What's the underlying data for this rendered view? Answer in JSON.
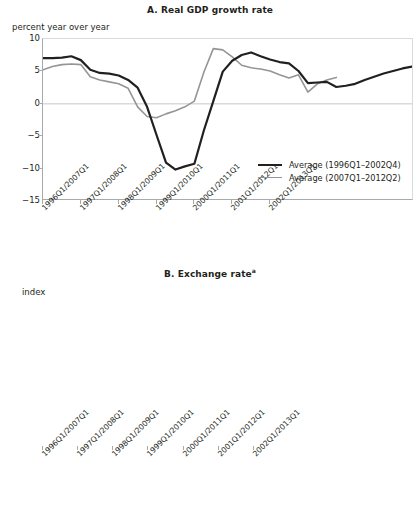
{
  "figure": {
    "panels": [
      {
        "id": "A",
        "title": "A. Real GDP growth rate",
        "title_superscript": "",
        "axis_unit": "percent year over year"
      },
      {
        "id": "B",
        "title": "B. Exchange rate",
        "title_superscript": "a",
        "axis_unit": "index"
      }
    ]
  },
  "legend": {
    "series_black": "Average (1996Q1–2002Q4)",
    "series_gray": "Average (2007Q1–2012Q2)",
    "color_black": "#231f20",
    "color_gray": "#939598"
  },
  "chart_data": [
    {
      "type": "line",
      "title": "A. Real GDP growth rate",
      "xlabel": "",
      "ylabel": "percent year over year",
      "ylim": [
        -15,
        10
      ],
      "yticks": [
        10,
        5,
        0,
        -5,
        -10,
        -15
      ],
      "ytick_labels": [
        "10",
        "5",
        "0",
        "−5",
        "−10",
        "−15"
      ],
      "xticks": [
        0,
        4,
        8,
        12,
        16,
        20,
        24
      ],
      "xtick_labels": [
        "1996Q1/2007Q1",
        "1997Q1/2008Q1",
        "1998Q1/2009Q1",
        "1999Q1/2010Q1",
        "2000Q1/2011Q1",
        "2001Q1/2012Q1",
        "2002Q1/2013Q1"
      ],
      "grid": false,
      "zero_line": true,
      "legend_position": "lower-right",
      "x": [
        0,
        1,
        2,
        3,
        4,
        5,
        6,
        7,
        8,
        9,
        10,
        11,
        12,
        13,
        14,
        15,
        16,
        17,
        18,
        19,
        20,
        21,
        22,
        23,
        24,
        25,
        26
      ],
      "series": [
        {
          "name": "Average (1996Q1–2002Q4)",
          "color": "#231f20",
          "values": [
            7.0,
            7.0,
            7.1,
            7.3,
            6.7,
            5.2,
            4.7,
            4.6,
            4.3,
            3.6,
            2.4,
            -0.6,
            -5.0,
            -9.3,
            -10.4,
            -9.9,
            -9.5,
            -4.3,
            0.3,
            4.9,
            6.6,
            7.5,
            7.9,
            7.3,
            6.8,
            6.4,
            6.2
          ]
        },
        {
          "name": "Average (2007Q1–2012Q2)",
          "color": "#939598",
          "values": [
            5.2,
            5.7,
            6.0,
            6.1,
            6.0,
            4.1,
            3.6,
            3.3,
            3.0,
            2.3,
            -0.6,
            -2.1,
            -2.3,
            -1.7,
            -1.2,
            -0.6,
            0.3,
            4.8,
            8.5,
            8.3,
            7.2,
            5.9,
            5.5,
            5.3,
            5.0,
            4.4,
            3.9
          ]
        }
      ],
      "series_extended": [
        {
          "name": "Average (1996Q1–2002Q4)",
          "color": "#231f20",
          "values_tail": [
            5.0,
            3.1,
            3.2,
            3.3,
            2.5,
            2.7,
            3.0,
            3.6,
            4.1,
            4.6,
            5.0,
            5.4,
            5.7
          ]
        },
        {
          "name": "Average (2007Q1–2012Q2)",
          "color": "#939598",
          "values_tail": [
            4.4,
            1.7,
            3.0,
            3.6,
            4.0
          ]
        }
      ]
    },
    {
      "type": "line",
      "title": "B. Exchange rate",
      "title_note": "a",
      "xlabel": "",
      "ylabel": "index",
      "ylim": [
        0,
        250
      ],
      "yticks": [
        250,
        200,
        150,
        100,
        50,
        0
      ],
      "ytick_labels": [
        "250",
        "200",
        "150",
        "100",
        "50",
        "0"
      ],
      "xticks": [
        0,
        4,
        8,
        12,
        16,
        20,
        24
      ],
      "xtick_labels": [
        "1996Q1/2007Q1",
        "1997Q1/2008Q1",
        "1998Q1/2009Q1",
        "1999Q1/2010Q1",
        "2000Q1/2011Q1",
        "2001Q1/2012Q1",
        "2002Q1/2013Q1"
      ],
      "grid": false,
      "legend_position": "lower-right",
      "x": [
        0,
        1,
        2,
        3,
        4,
        5,
        6,
        7,
        8,
        9,
        10,
        11,
        12,
        13,
        14,
        15,
        16,
        17,
        18,
        19,
        20,
        21,
        22,
        23,
        24,
        25,
        26,
        27
      ],
      "series": [
        {
          "name": "Average (1996Q1–2002Q4)",
          "color": "#231f20",
          "values": [
            100,
            100,
            100,
            100,
            101,
            102,
            103,
            105,
            106,
            118,
            150,
            186,
            221,
            220,
            218,
            227,
            236,
            205,
            191,
            194,
            193,
            189,
            187,
            186,
            184,
            184,
            190,
            197
          ]
        },
        {
          "name": "Average (2007Q1–2012Q2)",
          "color": "#939598",
          "values": [
            100,
            100,
            99,
            97,
            96,
            95,
            96,
            99,
            101,
            107,
            112,
            115,
            114,
            112,
            110,
            108,
            106,
            104,
            102,
            100,
            99,
            97,
            96,
            95,
            94,
            94,
            95,
            97
          ]
        }
      ],
      "series_extended": [
        {
          "name": "Average (1996Q1–2002Q4)",
          "color": "#231f20",
          "values_tail": [
            203,
            210,
            218,
            226,
            234,
            226,
            220,
            223,
            226,
            225,
            222,
            215,
            211,
            210,
            213
          ]
        },
        {
          "name": "Average (2007Q1–2012Q2)",
          "color": "#939598",
          "values_tail": [
            97,
            98,
            98
          ]
        }
      ]
    }
  ]
}
